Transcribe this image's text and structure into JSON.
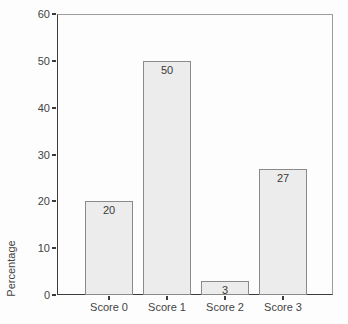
{
  "chart_data": {
    "type": "bar",
    "title": "",
    "categories": [
      "Score 0",
      "Score 1",
      "Score 2",
      "Score 3"
    ],
    "values": [
      20,
      50,
      3,
      27
    ],
    "bar_value_labels": [
      "20",
      "50",
      "3",
      "27"
    ],
    "xlabel": "",
    "ylabel": "Percentage",
    "ylim": [
      0,
      60
    ],
    "yticks": [
      0,
      10,
      20,
      30,
      40,
      50,
      60
    ],
    "grid": false,
    "legend": false,
    "colors": {
      "bar_fill": "#ececec",
      "bar_border": "#8a8a8a",
      "axis_dark": "#3c3c3c",
      "frame_light": "#9c9c9c",
      "text": "#444444",
      "background": "#fdfdfd"
    }
  }
}
